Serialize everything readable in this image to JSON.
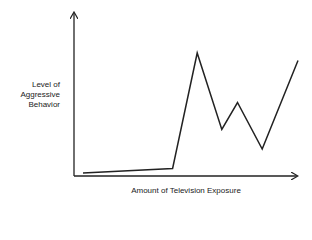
{
  "chart_data": {
    "type": "line",
    "title": "",
    "xlabel": "Amount of Television Exposure",
    "ylabel": "Level of Aggressive Behavior",
    "ylabel_lines": [
      "Level of",
      "Aggressive",
      "Behavior"
    ],
    "grid": false,
    "legend": null,
    "x_ticks": [],
    "y_ticks": [],
    "xlim": [
      0,
      100
    ],
    "ylim": [
      0,
      100
    ],
    "x": [
      4,
      44,
      55,
      66,
      73,
      84,
      100
    ],
    "values": [
      2,
      5,
      82,
      31,
      49,
      18,
      77
    ],
    "note": "Schematic curve without numeric axis labels; values are relative estimates on a 0-100 scale."
  }
}
